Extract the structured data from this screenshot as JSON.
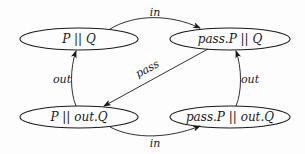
{
  "diagram": {
    "type": "state-transition",
    "nodes": [
      {
        "id": "n1",
        "label": "P || Q",
        "cx": 79,
        "cy": 39
      },
      {
        "id": "n2",
        "label": "pass.P || Q",
        "cx": 230,
        "cy": 39
      },
      {
        "id": "n3",
        "label": "P || out.Q",
        "cx": 79,
        "cy": 117
      },
      {
        "id": "n4",
        "label": "pass.P || out.Q",
        "cx": 230,
        "cy": 117
      }
    ],
    "edges": [
      {
        "from": "n1",
        "to": "n2",
        "label": "in"
      },
      {
        "from": "n2",
        "to": "n3",
        "label": "pass"
      },
      {
        "from": "n3",
        "to": "n1",
        "label": "out"
      },
      {
        "from": "n3",
        "to": "n4",
        "label": "in"
      },
      {
        "from": "n4",
        "to": "n2",
        "label": "out"
      }
    ]
  }
}
